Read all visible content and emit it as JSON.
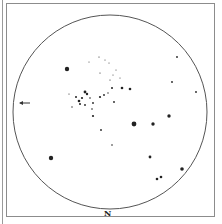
{
  "finder_chart": {
    "orientation_label": "N",
    "field_circle": {
      "cx": 110,
      "cy": 112,
      "r": 97,
      "color": "#555555"
    },
    "pointer_arrow": {
      "x": 20,
      "y": 103,
      "direction": "left"
    },
    "star_color": "#222222",
    "stars": [
      {
        "x": 67,
        "y": 69,
        "r": 2.2
      },
      {
        "x": 134,
        "y": 124,
        "r": 2.4
      },
      {
        "x": 153,
        "y": 124,
        "r": 1.7
      },
      {
        "x": 169,
        "y": 116,
        "r": 1.7
      },
      {
        "x": 150,
        "y": 157,
        "r": 1.4
      },
      {
        "x": 182,
        "y": 169,
        "r": 1.8
      },
      {
        "x": 157,
        "y": 179,
        "r": 1.3
      },
      {
        "x": 161,
        "y": 177,
        "r": 1.3
      },
      {
        "x": 177,
        "y": 57,
        "r": 0.9
      },
      {
        "x": 172,
        "y": 82,
        "r": 0.9
      },
      {
        "x": 196,
        "y": 92,
        "r": 0.9
      },
      {
        "x": 93,
        "y": 116,
        "r": 1.1
      },
      {
        "x": 101,
        "y": 130,
        "r": 0.9
      },
      {
        "x": 112,
        "y": 145,
        "r": 0.8
      },
      {
        "x": 51,
        "y": 158,
        "r": 2.2
      },
      {
        "x": 85,
        "y": 92,
        "r": 1.4
      },
      {
        "x": 87,
        "y": 94,
        "r": 1.2
      },
      {
        "x": 82,
        "y": 98,
        "r": 1.1
      },
      {
        "x": 79,
        "y": 101,
        "r": 1.3
      },
      {
        "x": 80,
        "y": 104,
        "r": 1.0
      },
      {
        "x": 76,
        "y": 97,
        "r": 1.0
      },
      {
        "x": 90,
        "y": 98,
        "r": 0.8
      },
      {
        "x": 93,
        "y": 103,
        "r": 0.9
      },
      {
        "x": 85,
        "y": 105,
        "r": 0.9
      },
      {
        "x": 92,
        "y": 109,
        "r": 0.8
      },
      {
        "x": 100,
        "y": 97,
        "r": 1.1
      },
      {
        "x": 104,
        "y": 95,
        "r": 0.9
      },
      {
        "x": 108,
        "y": 93,
        "r": 0.7
      },
      {
        "x": 112,
        "y": 88,
        "r": 1.0
      },
      {
        "x": 122,
        "y": 88,
        "r": 1.3
      },
      {
        "x": 130,
        "y": 89,
        "r": 1.3
      },
      {
        "x": 114,
        "y": 102,
        "r": 0.9
      },
      {
        "x": 72,
        "y": 107,
        "r": 0.7
      },
      {
        "x": 69,
        "y": 94,
        "r": 0.6
      },
      {
        "x": 99,
        "y": 57,
        "r": 0.6
      },
      {
        "x": 105,
        "y": 60,
        "r": 0.5
      },
      {
        "x": 109,
        "y": 63,
        "r": 0.5
      },
      {
        "x": 100,
        "y": 73,
        "r": 0.6
      },
      {
        "x": 89,
        "y": 62,
        "r": 0.5
      },
      {
        "x": 113,
        "y": 75,
        "r": 0.5
      },
      {
        "x": 110,
        "y": 80,
        "r": 0.6
      },
      {
        "x": 120,
        "y": 78,
        "r": 0.5
      },
      {
        "x": 116,
        "y": 70,
        "r": 0.5
      }
    ]
  }
}
